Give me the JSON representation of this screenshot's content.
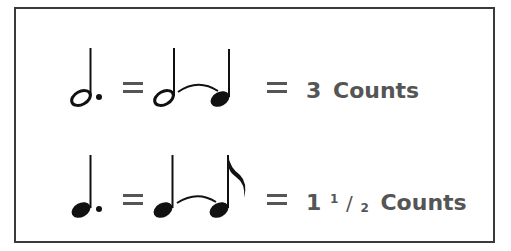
{
  "rows": [
    {
      "left_note": "dotted-half-note",
      "tied_notes": [
        "half-note",
        "quarter-note"
      ],
      "equals_symbol": "=",
      "count_number": "3",
      "count_fraction": "",
      "count_label": "Counts"
    },
    {
      "left_note": "dotted-quarter-note",
      "tied_notes": [
        "quarter-note",
        "eighth-note"
      ],
      "equals_symbol": "=",
      "count_number": "1",
      "count_fraction_num": "1",
      "count_fraction_den": "2",
      "count_label": "Counts"
    }
  ],
  "colors": {
    "ink": "#111111",
    "text": "#555555",
    "border": "#3a3a3a"
  }
}
